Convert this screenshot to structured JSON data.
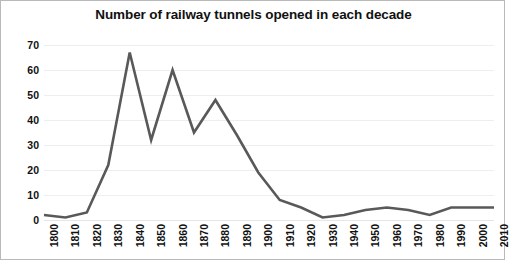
{
  "chart_data": {
    "type": "line",
    "title": "Number of railway tunnels opened in each decade",
    "xlabel": "",
    "ylabel": "",
    "categories": [
      "1800",
      "1810",
      "1820",
      "1830",
      "1840",
      "1850",
      "1860",
      "1870",
      "1880",
      "1890",
      "1900",
      "1910",
      "1920",
      "1930",
      "1940",
      "1950",
      "1960",
      "1970",
      "1980",
      "1990",
      "2000",
      "2010"
    ],
    "values": [
      2,
      1,
      3,
      22,
      67,
      32,
      60,
      35,
      48,
      34,
      19,
      8,
      5,
      1,
      2,
      4,
      5,
      4,
      2,
      5,
      5,
      5
    ],
    "series": [
      {
        "name": "Tunnels opened",
        "values": [
          2,
          1,
          3,
          22,
          67,
          32,
          60,
          35,
          48,
          34,
          19,
          8,
          5,
          1,
          2,
          4,
          5,
          4,
          2,
          5,
          5,
          5
        ]
      }
    ],
    "ylim": [
      0,
      70
    ],
    "y_ticks": [
      0,
      10,
      20,
      30,
      40,
      50,
      60,
      70
    ],
    "y_tick_labels": [
      "0",
      "10",
      "20",
      "30",
      "40",
      "50",
      "60",
      "70"
    ],
    "grid": true,
    "legend": false,
    "legend_position": "none",
    "line_color": "#595959",
    "grid_color": "#ECEFF1",
    "text_color": "#111111",
    "background_color": "#FFFFFF",
    "border_color": "#B9B9B9",
    "x_tick_rotation": 90
  }
}
